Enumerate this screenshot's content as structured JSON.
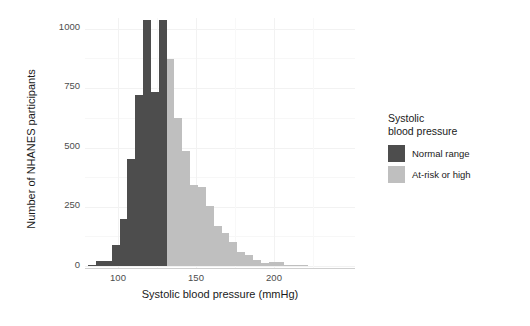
{
  "chart_data": {
    "type": "bar",
    "title": "",
    "subtitle": "",
    "xlabel": "Systolic blood pressure (mmHg)",
    "ylabel": "Number of NHANES participants",
    "xlim": [
      68,
      240
    ],
    "ylim": [
      0,
      1060
    ],
    "xticks": [
      100,
      150,
      200
    ],
    "yticks": [
      0,
      250,
      500,
      750,
      1000
    ],
    "grid": true,
    "bin_width": 5,
    "threshold": 120,
    "legend": {
      "position": "right",
      "title": "Systolic\nblood pressure",
      "title_line1": "Systolic",
      "title_line2": "blood pressure",
      "entries": [
        {
          "label": "Normal range",
          "color": "#4d4d4d"
        },
        {
          "label": "At-risk or high",
          "color": "#bfbfbf"
        }
      ]
    },
    "series": [
      {
        "name": "Normal range",
        "color": "#4d4d4d",
        "bins": [
          {
            "x": 72.5,
            "value": 5
          },
          {
            "x": 77.5,
            "value": 20
          },
          {
            "x": 82.5,
            "value": 20
          },
          {
            "x": 87.5,
            "value": 90
          },
          {
            "x": 92.5,
            "value": 200
          },
          {
            "x": 97.5,
            "value": 450
          },
          {
            "x": 102.5,
            "value": 720
          },
          {
            "x": 107.5,
            "value": 1040
          },
          {
            "x": 112.5,
            "value": 735
          },
          {
            "x": 117.5,
            "value": 1040
          }
        ]
      },
      {
        "name": "At-risk or high",
        "color": "#bfbfbf",
        "bins": [
          {
            "x": 122.5,
            "value": 875
          },
          {
            "x": 127.5,
            "value": 625
          },
          {
            "x": 132.5,
            "value": 485
          },
          {
            "x": 137.5,
            "value": 340
          },
          {
            "x": 142.5,
            "value": 335
          },
          {
            "x": 147.5,
            "value": 255
          },
          {
            "x": 152.5,
            "value": 170
          },
          {
            "x": 157.5,
            "value": 140
          },
          {
            "x": 162.5,
            "value": 100
          },
          {
            "x": 167.5,
            "value": 60
          },
          {
            "x": 172.5,
            "value": 45
          },
          {
            "x": 177.5,
            "value": 25
          },
          {
            "x": 182.5,
            "value": 12
          },
          {
            "x": 187.5,
            "value": 18
          },
          {
            "x": 192.5,
            "value": 18
          },
          {
            "x": 197.5,
            "value": 5
          },
          {
            "x": 202.5,
            "value": 3
          },
          {
            "x": 207.5,
            "value": 2
          }
        ]
      }
    ]
  },
  "colors": {
    "normal": "#4d4d4d",
    "at_risk": "#bfbfbf",
    "grid": "#f2f2f2",
    "axis_text": "#4d4d4d",
    "title_text": "#1a1a1a",
    "background": "#ffffff"
  }
}
